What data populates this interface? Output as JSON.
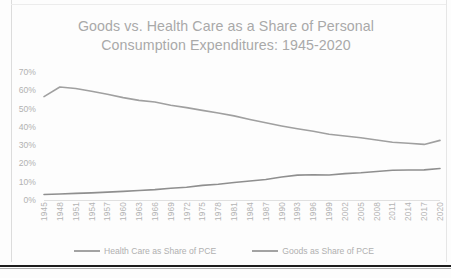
{
  "chart_data": {
    "type": "line",
    "title": "Goods vs. Health Care as a Share of Personal\nConsumption Expenditures: 1945-2020",
    "xlabel": "",
    "ylabel": "",
    "ylim": [
      0,
      70
    ],
    "ytick_labels": [
      "70%",
      "60%",
      "50%",
      "40%",
      "30%",
      "20%",
      "10%",
      "0%"
    ],
    "ytick_values": [
      70,
      60,
      50,
      40,
      30,
      20,
      10,
      0
    ],
    "grid": false,
    "legend_position": "bottom",
    "x": [
      1945,
      1948,
      1951,
      1954,
      1957,
      1960,
      1963,
      1966,
      1969,
      1972,
      1975,
      1978,
      1981,
      1984,
      1987,
      1990,
      1993,
      1996,
      1999,
      2002,
      2005,
      2008,
      2011,
      2014,
      2017,
      2020
    ],
    "tick_labels": [
      "1945",
      "1948",
      "1951",
      "1954",
      "1957",
      "1960",
      "1963",
      "1966",
      "1969",
      "1972",
      "1975",
      "1978",
      "1981",
      "1984",
      "1987",
      "1990",
      "1993",
      "1996",
      "1999",
      "2002",
      "2005",
      "2008",
      "2011",
      "2014",
      "2017",
      "2020"
    ],
    "series": [
      {
        "name": "Goods as Share of PCE",
        "color": "#a0a0a0",
        "values": [
          56.5,
          61.8,
          61.0,
          59.5,
          57.8,
          56.0,
          54.5,
          53.6,
          51.8,
          50.5,
          49.0,
          47.6,
          46.0,
          44.0,
          42.2,
          40.5,
          39.0,
          37.6,
          36.0,
          35.0,
          34.0,
          32.8,
          31.6,
          31.0,
          30.4,
          32.6
        ]
      },
      {
        "name": "Health Care as Share of PCE",
        "color": "#8f8f8f",
        "values": [
          3.0,
          3.3,
          3.6,
          3.9,
          4.3,
          4.7,
          5.2,
          5.7,
          6.4,
          7.0,
          8.0,
          8.6,
          9.6,
          10.4,
          11.2,
          12.6,
          13.6,
          13.8,
          13.7,
          14.4,
          14.9,
          15.6,
          16.3,
          16.4,
          16.5,
          17.2
        ]
      }
    ]
  },
  "legend": {
    "items": [
      {
        "label": "Health Care as Share of PCE"
      },
      {
        "label": "Goods as Share of PCE"
      }
    ]
  }
}
